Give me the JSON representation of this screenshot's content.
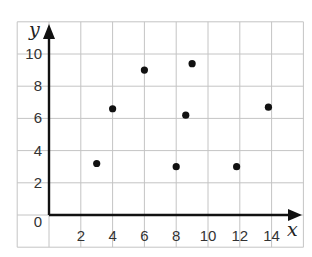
{
  "chart_data": {
    "type": "scatter",
    "title": "",
    "xlabel": "x",
    "ylabel": "y",
    "xlim": [
      -2,
      16
    ],
    "ylim": [
      -2,
      12
    ],
    "grid": true,
    "legend": null,
    "x_ticks": [
      2,
      4,
      6,
      8,
      10,
      12,
      14
    ],
    "y_ticks": [
      0,
      2,
      4,
      6,
      8,
      10
    ],
    "points": [
      {
        "x": 3,
        "y": 3.2
      },
      {
        "x": 4,
        "y": 6.6
      },
      {
        "x": 6,
        "y": 9
      },
      {
        "x": 8,
        "y": 3
      },
      {
        "x": 8.6,
        "y": 6.2
      },
      {
        "x": 9,
        "y": 9.4
      },
      {
        "x": 11.8,
        "y": 3
      },
      {
        "x": 13.8,
        "y": 6.7
      }
    ]
  },
  "colors": {
    "grid": "#c4c4c4",
    "axis": "#111111",
    "point": "#111111",
    "label": "#333333"
  }
}
